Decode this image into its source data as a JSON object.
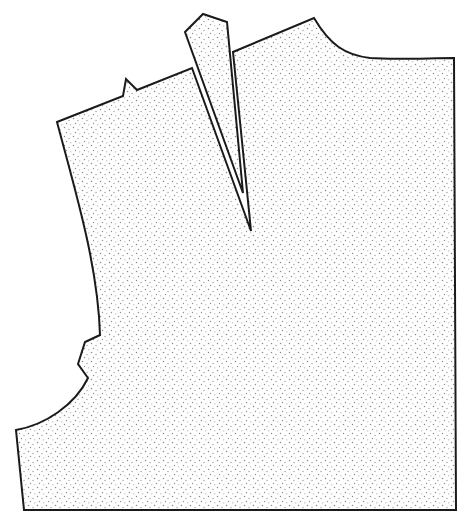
{
  "diagram": {
    "type": "sewing-pattern-piece",
    "colors": {
      "background": "#ffffff",
      "outline": "#1a1a1a",
      "stipple": "#8a8a8a"
    },
    "pieces": [
      {
        "name": "bodice-body",
        "path": "M57,122 L123,96 L126,79 L137,90 L192,68 L251,231 L233,52 L314,18 C330,45 345,55 370,58 C395,60 430,58 454,58 L456,510 L24,510 L16,430 C45,425 75,405 88,378 L78,364 L85,342 L100,335 C98,265 75,190 57,122 Z"
      },
      {
        "name": "dart-flap",
        "path": "M185,32 L203,14 L227,22 L243,193 Z"
      }
    ],
    "dart_point": [
      251,
      231
    ],
    "dart_flap_tip": [
      243,
      193
    ]
  }
}
